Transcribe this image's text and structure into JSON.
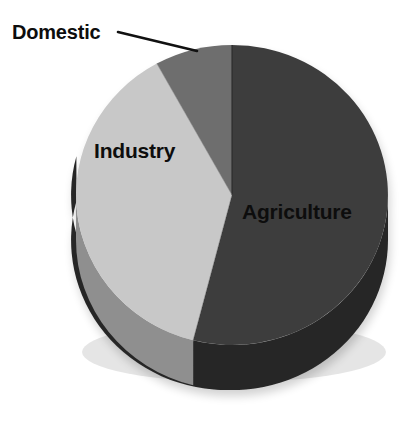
{
  "chart_data": {
    "type": "pie",
    "title": "",
    "subtitle": "",
    "xlabel": "",
    "ylabel": "",
    "style": "3d-pie",
    "legend_position": "none",
    "grid": false,
    "labels_inline": true,
    "categories": [
      "Agriculture",
      "Industry",
      "Domestic"
    ],
    "values": [
      54,
      38,
      8
    ],
    "value_unit": "percent",
    "slices": [
      {
        "label": "Agriculture",
        "value": 54,
        "start_angle_deg": 0,
        "end_angle_deg": 195,
        "color": "#3d3d3d",
        "side_color": "#272727",
        "label_placement": "inside",
        "label_color": "#0d0d0d"
      },
      {
        "label": "Industry",
        "value": 38,
        "start_angle_deg": 195,
        "end_angle_deg": 333,
        "color": "#c8c8c8",
        "side_color": "#8f8f8f",
        "label_placement": "inside",
        "label_color": "#0d0d0d"
      },
      {
        "label": "Domestic",
        "value": 8,
        "start_angle_deg": 333,
        "end_angle_deg": 360,
        "color": "#6e6e6e",
        "side_color": "#4a4a4a",
        "label_placement": "outside-leader",
        "label_color": "#0d0d0d"
      }
    ],
    "geometry": {
      "center_x": 232,
      "center_y": 195,
      "radius_x": 156,
      "radius_y": 150,
      "depth": 45
    },
    "background_color": "#ffffff"
  },
  "labels": {
    "domestic": "Domestic",
    "industry": "Industry",
    "agriculture": "Agriculture"
  },
  "leader_line": {
    "from_x": 118,
    "from_y": 32,
    "to_x": 197,
    "to_y": 51,
    "color": "#111111"
  }
}
